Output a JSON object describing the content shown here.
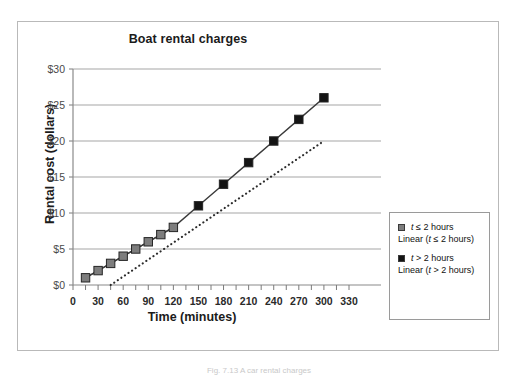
{
  "figure": {
    "caption": "Fig. 7.13  A car rental charges"
  },
  "legend": {
    "entries": [
      {
        "label_prefix": "t",
        "label_rest": " ≤ 2 hours",
        "swatch": "#7d7d7d",
        "swatch_name": "legend-swatch-gray"
      },
      {
        "label_prefix": "t",
        "label_rest": " > 2 hours",
        "swatch": "#141414",
        "swatch_name": "legend-swatch-black"
      }
    ],
    "trend_labels": [
      {
        "prefix": "Linear (",
        "it": "t",
        "rest": " ≤ 2 hours)"
      },
      {
        "prefix": "Linear (",
        "it": "t",
        "rest": " > 2 hours)"
      }
    ]
  },
  "chart_data": {
    "type": "scatter",
    "title": "Boat rental charges",
    "xlabel": "Time (minutes)",
    "ylabel": "Rental cost (dollars)",
    "xlim": [
      0,
      330
    ],
    "ylim": [
      0,
      30
    ],
    "xticks": [
      0,
      30,
      60,
      90,
      120,
      150,
      180,
      210,
      240,
      270,
      300,
      330
    ],
    "xtick_labels": [
      "0",
      "30",
      "60",
      "90",
      "120",
      "150",
      "180",
      "210",
      "240",
      "270",
      "300",
      "330"
    ],
    "xminor_step": 15,
    "yticks": [
      0,
      5,
      10,
      15,
      20,
      25,
      30
    ],
    "ytick_labels": [
      "$0",
      "$5",
      "$10",
      "$15",
      "$20",
      "$25",
      "$30"
    ],
    "grid": "horizontal",
    "legend_position": "right-outside",
    "series": [
      {
        "name": "t ≤ 2 hours",
        "marker": "square",
        "color": "#7d7d7d",
        "line": "solid",
        "x": [
          15,
          30,
          45,
          60,
          75,
          90,
          105,
          120
        ],
        "values": [
          1,
          2,
          3,
          4,
          5,
          6,
          7,
          8
        ]
      },
      {
        "name": "t > 2 hours",
        "marker": "square",
        "color": "#141414",
        "line": "solid",
        "x": [
          150,
          180,
          210,
          240,
          270,
          300
        ],
        "values": [
          11,
          14,
          17,
          20,
          23,
          26
        ]
      },
      {
        "name": "Linear (t ≤ 2 hours)",
        "marker": "none",
        "color": "#555555",
        "line": "solid",
        "x": [
          15,
          120
        ],
        "values": [
          1,
          8
        ]
      },
      {
        "name": "Linear (t > 2 hours)",
        "marker": "none",
        "color": "#2b2b2b",
        "line": "dotted",
        "x": [
          45,
          300
        ],
        "values": [
          0,
          20
        ]
      }
    ]
  }
}
